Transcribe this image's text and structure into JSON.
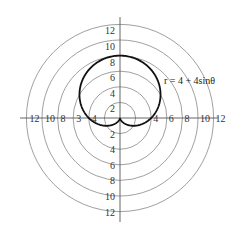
{
  "chart_data": {
    "type": "line",
    "subtype": "polar",
    "title": "",
    "equation_label": "r = 4 + 4sinθ",
    "series": [
      {
        "name": "r = 4 + 4sinθ",
        "function": "4 + 4*sin(theta)",
        "theta_range": [
          0,
          6.2832
        ],
        "sample_points": [
          {
            "theta_deg": 0,
            "r": 4
          },
          {
            "theta_deg": 90,
            "r": 8
          },
          {
            "theta_deg": 180,
            "r": 4
          },
          {
            "theta_deg": 270,
            "r": 0
          }
        ]
      }
    ],
    "radial_rings": [
      2,
      4,
      6,
      8,
      10,
      12
    ],
    "axis_labels": {
      "top": [
        "12",
        "10",
        "8",
        "6",
        "4",
        "2"
      ],
      "bottom": [
        "2",
        "4",
        "6",
        "8",
        "10",
        "12"
      ],
      "left": [
        "12",
        "10",
        "8",
        "3",
        "4"
      ],
      "right": [
        "4",
        "6",
        "8",
        "10",
        "12"
      ]
    },
    "rlim": [
      0,
      12
    ],
    "grid": true,
    "legend": "none"
  }
}
